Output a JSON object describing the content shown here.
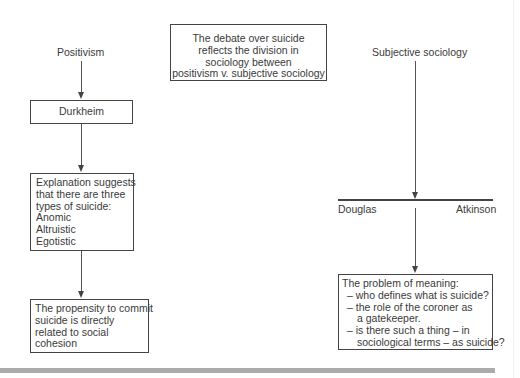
{
  "diagram": {
    "title_box": {
      "lines": [
        "The debate over suicide",
        "reflects the division in",
        "sociology between",
        "positivism v. subjective sociology"
      ]
    },
    "left_branch": {
      "heading": "Positivism",
      "node1": "Durkheim",
      "node2": {
        "lines": [
          "Explanation suggests",
          "that there are three",
          "types of suicide:",
          "Anomic",
          "Altruistic",
          "Egotistic"
        ]
      },
      "node3": {
        "lines": [
          "The propensity to commit",
          "suicide is directly",
          "related to social",
          "cohesion"
        ]
      }
    },
    "right_branch": {
      "heading": "Subjective sociology",
      "split_left": "Douglas",
      "split_right": "Atkinson",
      "node": {
        "title": "The problem of meaning:",
        "items": [
          {
            "line1": "– who defines what is suicide?"
          },
          {
            "line1": "– the role of the coroner as",
            "line2": "a gatekeeper."
          },
          {
            "line1": "– is there such a thing – in",
            "line2": "sociological terms – as suicide?"
          }
        ]
      }
    },
    "colors": {
      "line": "#444444",
      "text": "#3a3a3a",
      "bottom_bar": "#ababab"
    }
  }
}
